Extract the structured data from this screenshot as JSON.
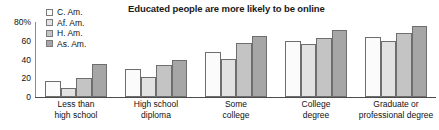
{
  "chart_data": {
    "type": "bar",
    "title": "Educated people are more likely to be online",
    "xlabel": "",
    "ylabel": "",
    "ylim": [
      0,
      80
    ],
    "yticks": [
      0,
      20,
      40,
      60,
      80
    ],
    "ytick_labels": [
      "0",
      "20",
      "40",
      "60",
      "80%"
    ],
    "grid": false,
    "legend_position": "top-left",
    "categories": [
      "Less than high school",
      "High school diploma",
      "Some college",
      "College degree",
      "Graduate or professional degree"
    ],
    "category_lines": [
      [
        "Less than",
        "high school"
      ],
      [
        "High school",
        "diploma"
      ],
      [
        "Some",
        "college"
      ],
      [
        "College",
        "degree"
      ],
      [
        "Graduate or",
        "professional degree"
      ]
    ],
    "series": [
      {
        "name": "C. Am.",
        "color": "#fbfbfb",
        "values": [
          17,
          30,
          48,
          60,
          64
        ]
      },
      {
        "name": "Af. Am.",
        "color": "#e2e2e2",
        "values": [
          10,
          21,
          41,
          57,
          60
        ]
      },
      {
        "name": "H. Am.",
        "color": "#c4c4c4",
        "values": [
          20,
          34,
          58,
          63,
          68
        ]
      },
      {
        "name": "As. Am.",
        "color": "#a6a6a6",
        "values": [
          35,
          40,
          65,
          72,
          76
        ]
      }
    ]
  },
  "legend": {
    "items": [
      {
        "label": "C. Am.",
        "color": "#fbfbfb"
      },
      {
        "label": "Af. Am.",
        "color": "#e2e2e2"
      },
      {
        "label": "H. Am.",
        "color": "#c4c4c4"
      },
      {
        "label": "As. Am.",
        "color": "#a6a6a6"
      }
    ]
  },
  "colors": {
    "axis": "#4d4d4d",
    "bar_outline": "#6e6e6e",
    "text": "#111111",
    "background": "#ffffff"
  }
}
